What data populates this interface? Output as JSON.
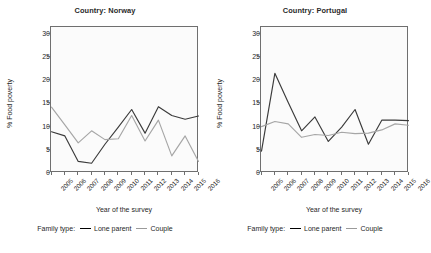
{
  "chart_data": {
    "type": "line",
    "title": "",
    "xlabel": "Year of the survey",
    "ylabel": "% Food poverty",
    "ylim": [
      0,
      31.5
    ],
    "yticks": [
      0,
      5,
      10,
      15,
      20,
      25,
      30
    ],
    "grid": false,
    "legend_position": "bottom",
    "legend_title": "Family type:",
    "categories": [
      2005,
      2006,
      2007,
      2008,
      2009,
      2010,
      2011,
      2012,
      2013,
      2014,
      2015,
      2016
    ],
    "panels": [
      {
        "facet_label": "Country: Norway",
        "series": [
          {
            "name": "Lone parent",
            "color": "#3b3b3b",
            "values": [
              8.9,
              8.0,
              2.5,
              2.1,
              6.2,
              9.9,
              13.7,
              8.6,
              14.3,
              12.4,
              11.6,
              12.3
            ]
          },
          {
            "name": "Couple",
            "color": "#a6a6a6",
            "values": [
              14.2,
              10.4,
              6.5,
              9.1,
              7.2,
              7.4,
              12.4,
              6.9,
              11.4,
              3.7,
              8.0,
              2.5
            ]
          }
        ]
      },
      {
        "facet_label": "Country: Portugal",
        "series": [
          {
            "name": "Lone parent",
            "color": "#3b3b3b",
            "values": [
              4.7,
              21.5,
              15.2,
              9.1,
              12.1,
              6.8,
              9.9,
              13.7,
              6.2,
              11.4,
              11.4,
              11.3
            ]
          },
          {
            "name": "Couple",
            "color": "#a6a6a6",
            "values": [
              10.0,
              11.1,
              10.6,
              7.7,
              8.3,
              8.1,
              8.8,
              8.5,
              8.6,
              9.3,
              10.6,
              10.3
            ]
          }
        ]
      }
    ]
  },
  "axis": {
    "ylabel": "% Food poverty",
    "xlabel": "Year of the survey",
    "yticks": [
      "0",
      "5",
      "10",
      "15",
      "20",
      "25",
      "30"
    ],
    "xticks": [
      "2005",
      "2006",
      "2007",
      "2008",
      "2009",
      "2010",
      "2011",
      "2012",
      "2013",
      "2014",
      "2015",
      "2016"
    ]
  },
  "legend": {
    "title": "Family type:",
    "lone_parent": "Lone parent",
    "couple": "Couple"
  },
  "panel_left": {
    "title": "Country: Norway"
  },
  "panel_right": {
    "title": "Country: Portugal"
  },
  "colors": {
    "lone_parent": "#3b3b3b",
    "couple": "#a6a6a6",
    "axis": "#6f6f6f",
    "plot_bg": "#fbfbfb"
  }
}
